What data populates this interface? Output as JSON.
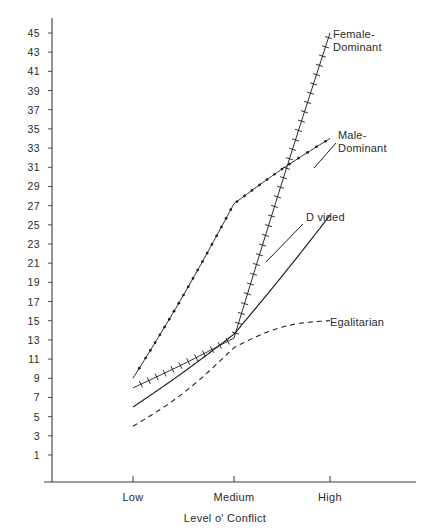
{
  "chart_data": {
    "type": "line",
    "title": "",
    "xlabel": "Level o' Conflict",
    "ylabel": "",
    "categories": [
      "Low",
      "Medium",
      "High"
    ],
    "x": [
      0,
      1,
      2
    ],
    "xlim": [
      -0.25,
      2.22
    ],
    "ylim": [
      0,
      46
    ],
    "grid": false,
    "legend_position": "right-inline-labels",
    "ytick_labels": [
      "45",
      "43",
      "41",
      "39",
      "37",
      "35",
      "33",
      "31",
      "29",
      "27",
      "25",
      "23",
      "21",
      "19",
      "17",
      "15",
      "13",
      "11",
      "9",
      "7",
      "5",
      "3",
      "1"
    ],
    "ytick_values": [
      45,
      43,
      41,
      39,
      37,
      35,
      33,
      31,
      29,
      27,
      25,
      23,
      21,
      19,
      17,
      15,
      13,
      11,
      9,
      7,
      5,
      3,
      1
    ],
    "xtick_labels": [
      "Low",
      "Medium",
      "High"
    ],
    "series": [
      {
        "name": "Female-Dominant",
        "style": "hatched-tick line",
        "values": [
          8.0,
          13.2,
          45.0
        ],
        "label": "Female-\nDominant"
      },
      {
        "name": "Male-Dominant",
        "style": "beaded-dot line",
        "values": [
          9.0,
          27.2,
          34.0
        ],
        "label": "Male-\nDominant"
      },
      {
        "name": "Divided",
        "style": "solid line",
        "values": [
          6.0,
          13.6,
          26.0
        ],
        "label": "D vided"
      },
      {
        "name": "Egalitarian",
        "style": "dashed line",
        "values": [
          4.0,
          12.2,
          15.0
        ],
        "label": "Egalitarian"
      }
    ]
  },
  "axes": {
    "x_axis_title": "Level o' Conflict"
  },
  "colors": {
    "axis": "#3a3a3a",
    "line": "#1d1d1d",
    "text": "#2b2b2b",
    "background": "#ffffff"
  }
}
